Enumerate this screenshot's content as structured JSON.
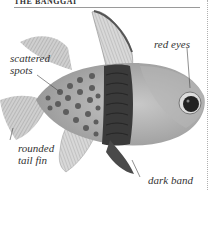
{
  "header": {
    "title": "THE BANGGAI"
  },
  "figure": {
    "labels": [
      {
        "id": "scattered-spots",
        "text_line1": "scattered",
        "text_line2": "spots"
      },
      {
        "id": "red-eyes",
        "text_line1": "red eyes"
      },
      {
        "id": "rounded-tail-fin",
        "text_line1": "rounded",
        "text_line2": "tail fin"
      },
      {
        "id": "dark-band",
        "text_line1": "dark band"
      }
    ]
  }
}
